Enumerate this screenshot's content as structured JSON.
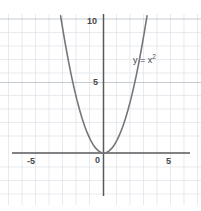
{
  "chart_data": {
    "type": "line",
    "title": "",
    "subtitle": "",
    "xlabel": "",
    "ylabel": "",
    "annotation": "y = x",
    "annotation_exponent": "2",
    "function": "y = x^2",
    "xlim": [
      -6.8,
      6.4
    ],
    "ylim": [
      -3.1,
      10.3
    ],
    "grid": true,
    "grid_step_x": 1,
    "grid_step_y": 1,
    "legend": "none",
    "x_ticks": [
      -5,
      0,
      5
    ],
    "x_tick_labels": [
      "-5",
      "0",
      "5"
    ],
    "y_ticks": [
      5,
      10
    ],
    "y_tick_labels": [
      "5",
      "10"
    ],
    "x": [
      -3.2,
      -3.0,
      -2.8,
      -2.6,
      -2.4,
      -2.2,
      -2.0,
      -1.8,
      -1.6,
      -1.4,
      -1.2,
      -1.0,
      -0.8,
      -0.6,
      -0.4,
      -0.2,
      0.0,
      0.2,
      0.4,
      0.6,
      0.8,
      1.0,
      1.2,
      1.4,
      1.6,
      1.8,
      2.0,
      2.2,
      2.4,
      2.6,
      2.8,
      3.0,
      3.2
    ],
    "values": [
      10.24,
      9.0,
      7.84,
      6.76,
      5.76,
      4.84,
      4.0,
      3.24,
      2.56,
      1.96,
      1.44,
      1.0,
      0.64,
      0.36,
      0.16,
      0.04,
      0.0,
      0.04,
      0.16,
      0.36,
      0.64,
      1.0,
      1.44,
      1.96,
      2.56,
      3.24,
      4.0,
      4.84,
      5.76,
      6.76,
      7.84,
      9.0,
      10.24
    ],
    "series": [
      {
        "name": "y = x^2",
        "values": [
          10.24,
          9.0,
          7.84,
          6.76,
          5.76,
          4.84,
          4.0,
          3.24,
          2.56,
          1.96,
          1.44,
          1.0,
          0.64,
          0.36,
          0.16,
          0.04,
          0.0,
          0.04,
          0.16,
          0.36,
          0.64,
          1.0,
          1.44,
          1.96,
          2.56,
          3.24,
          4.0,
          4.84,
          5.76,
          6.76,
          7.84,
          9.0,
          10.24
        ]
      }
    ]
  },
  "labels": {
    "ytick_10": "10",
    "ytick_5": "5",
    "origin": "0",
    "xtick_neg5": "-5",
    "xtick_5": "5",
    "annotation_base": "y = x",
    "annotation_sup": "2"
  },
  "colors": {
    "background": "#ffffff",
    "grid": "#d8dde4",
    "axis": "#58595b",
    "curve": "#6f7174",
    "text": "#4a4a4a",
    "emphasis_grid": "#b9bfc7"
  }
}
